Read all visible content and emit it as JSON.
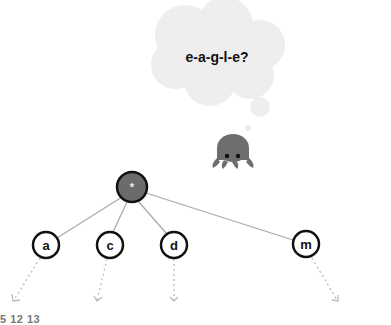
{
  "thought_bubble": {
    "text": "e-a-g-l-e?"
  },
  "character": {
    "icon": "octopus-icon"
  },
  "tree": {
    "root": {
      "label": "*",
      "color": "#6b6b6b"
    },
    "children": [
      {
        "label": "a"
      },
      {
        "label": "c"
      },
      {
        "label": "d"
      },
      {
        "label": "m"
      }
    ]
  },
  "caption": {
    "text": "5 12 13"
  }
}
